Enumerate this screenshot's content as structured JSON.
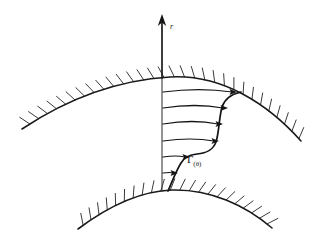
{
  "figure": {
    "background_color": "#ffffff",
    "ink_color": "#141414",
    "hatch_color": "#3a3a3a",
    "width": 327,
    "height": 245
  },
  "labels": {
    "radial_axis": "r",
    "profile_symbol": "Γ",
    "profile_subscript": "(θ)",
    "profile_full": "Γ(θ)"
  },
  "axis": {
    "name": "r-axis",
    "orientation": "vertical-up",
    "x": 162,
    "top_y": 14,
    "bottom_y": 192,
    "arrow_label": "r"
  },
  "outer_wall": {
    "name": "outer-wall",
    "description": "upper concave-down hatched boundary",
    "hatch_side": "above",
    "hatch_count": 30,
    "path": "M 22,129 C 70,97 120,80 170,77 C 222,74 268,104 301,141",
    "apex": [
      170,
      77
    ]
  },
  "inner_wall": {
    "name": "inner-wall",
    "description": "lower concave-down hatched boundary",
    "hatch_side": "above",
    "hatch_count": 22,
    "path": "M 78,229 C 110,205 142,191 172,190 C 210,189 245,205 272,228",
    "apex": [
      172,
      190
    ]
  },
  "velocity_arrows": [
    {
      "name": "flow-arrow-1",
      "y": 92,
      "x_start": 163,
      "x_end": 237,
      "curve_dip": 5,
      "magnitude": 74
    },
    {
      "name": "flow-arrow-2",
      "y": 108,
      "x_start": 163,
      "x_end": 228,
      "curve_dip": 5,
      "magnitude": 65
    },
    {
      "name": "flow-arrow-3",
      "y": 124,
      "x_start": 163,
      "x_end": 223,
      "curve_dip": 5,
      "magnitude": 60
    },
    {
      "name": "flow-arrow-4",
      "y": 141,
      "x_start": 163,
      "x_end": 219,
      "curve_dip": 4,
      "magnitude": 56
    },
    {
      "name": "flow-arrow-5",
      "y": 157,
      "x_start": 163,
      "x_end": 190,
      "curve_dip": 2,
      "magnitude": 27
    },
    {
      "name": "flow-arrow-6",
      "y": 173,
      "x_start": 163,
      "x_end": 178,
      "curve_dip": 1,
      "magnitude": 15
    }
  ],
  "profile_envelope": {
    "name": "velocity-profile-envelope",
    "description": "S-shaped curve connecting the arrow tips from inner wall to outer wall",
    "path": "M 168,191 C 172,182 176,171 181,163 C 185,157 189,155 197,154 C 207,153 213,150 216,142 C 219,133 219,118 222,107 C 225,98 232,94 241,92",
    "label": "Γ(θ)",
    "label_x": 187,
    "label_y": 163
  },
  "annotations": {
    "style": "hand-drawn scientific sketch",
    "line_style": "solid black ink on white"
  }
}
